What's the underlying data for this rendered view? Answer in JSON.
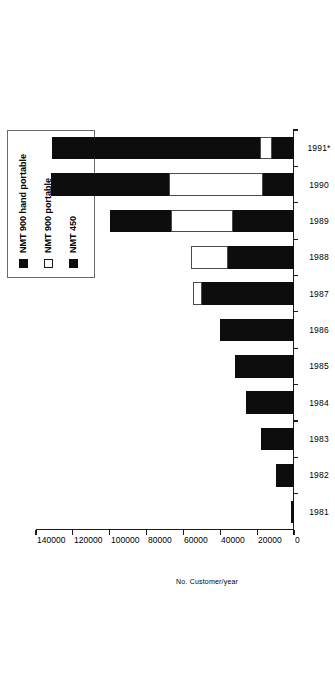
{
  "chart_data": {
    "type": "bar",
    "orientation": "horizontal",
    "stacked": true,
    "title": "",
    "xlabel": "No. Customer/year",
    "ylabel": "",
    "categories": [
      "1981",
      "1982",
      "1983",
      "1984",
      "1985",
      "1986",
      "1987",
      "1988",
      "1989",
      "1990",
      "1991*"
    ],
    "series": [
      {
        "name": "NMT 450",
        "color": "#0d0d0d",
        "values": [
          1600,
          10000,
          18000,
          26000,
          32000,
          40000,
          50000,
          36000,
          33000,
          17000,
          12000
        ]
      },
      {
        "name": "NMT 900 portable",
        "color": "#ffffff",
        "values": [
          0,
          0,
          0,
          0,
          0,
          0,
          5000,
          20000,
          34000,
          51000,
          6500
        ]
      },
      {
        "name": "NMT 900 hand portable",
        "color": "#0d0d0d",
        "values": [
          0,
          0,
          0,
          0,
          0,
          0,
          0,
          0,
          33000,
          64000,
          113000
        ]
      }
    ],
    "totals": [
      1600,
      10000,
      18000,
      26000,
      32000,
      40000,
      55000,
      56000,
      100000,
      132000,
      131500
    ],
    "xlim": [
      0,
      140000
    ],
    "xticks": [
      0,
      20000,
      40000,
      60000,
      80000,
      100000,
      120000,
      140000
    ],
    "xtick_labels": [
      "0",
      "20000",
      "40000",
      "60000",
      "80000",
      "100000",
      "120000",
      "140000"
    ],
    "grid": false,
    "legend_position": "top-right",
    "legend_entries": [
      {
        "label": "NMT 900 hand portable",
        "swatch": "dark"
      },
      {
        "label": "NMT 900 portable",
        "swatch": "light"
      },
      {
        "label": "NMT 450",
        "swatch": "dark"
      }
    ]
  }
}
